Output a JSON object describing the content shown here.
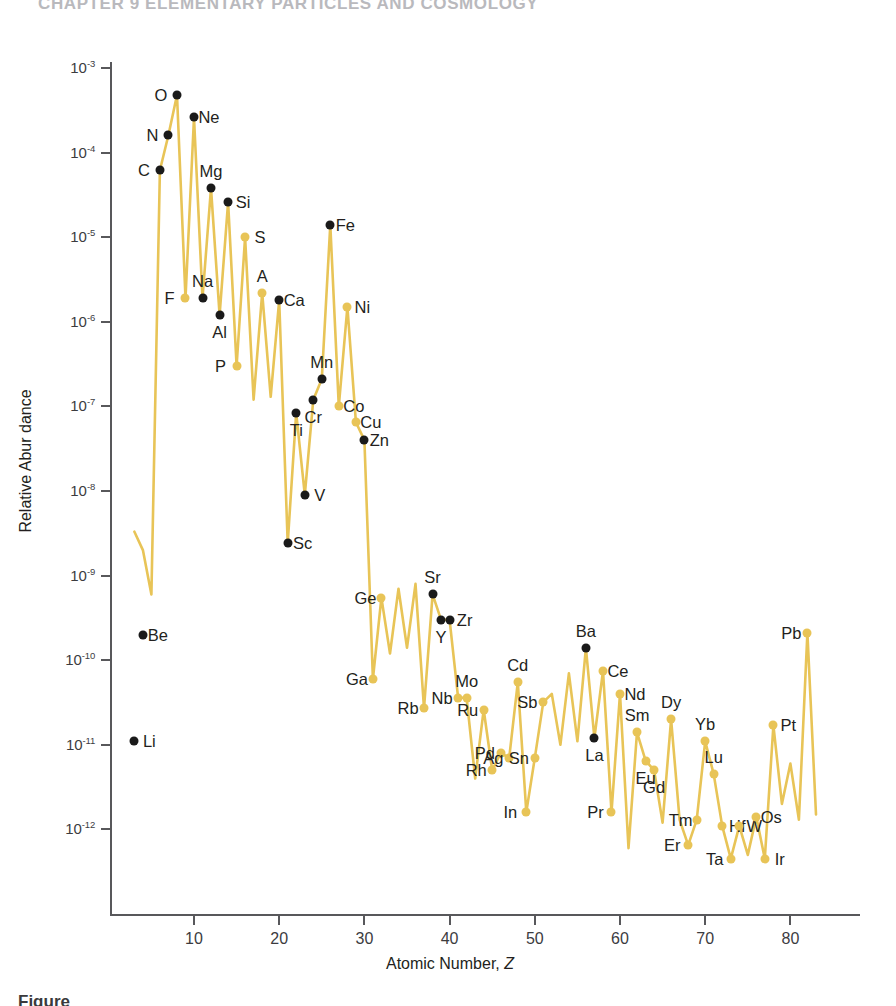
{
  "page": {
    "running_head": "CHAPTER 9   ELEMENTARY PARTICLES AND COSMOLOGY",
    "caption": "Figure"
  },
  "axes": {
    "ylabel": "Relative Abur dance",
    "xlabel_prefix": "Atomic Number, ",
    "xlabel_symbol": "Z",
    "yticks": [
      "10-3",
      "10-4",
      "10-5",
      "10-6",
      "10-7",
      "10-8",
      "10-9",
      "10-10",
      "10-11",
      "10-12"
    ],
    "xticks": [
      "10",
      "20",
      "30",
      "40",
      "50",
      "60",
      "70",
      "80"
    ]
  },
  "colors": {
    "gold": "#e8c457",
    "black": "#1a1a1a",
    "axis": "#58585b"
  },
  "chart_data": {
    "type": "scatter",
    "xlabel": "Atomic Number, Z",
    "ylabel": "Relative Abundance",
    "xlim": [
      1,
      84
    ],
    "ylim": [
      3e-13,
      0.002
    ],
    "yscale": "log",
    "grid": false,
    "legend": null,
    "note": "Black markers are labeled light/medium elements measured directly; gold markers and the gold zig-zag polyline trace the full abundance curve including the odd-even (Oddo-Harkins) sawtooth.",
    "points": [
      {
        "symbol": "Li",
        "z": 3,
        "abundance": 1.1e-11,
        "color": "black",
        "label_side": "right"
      },
      {
        "symbol": "Be",
        "z": 4,
        "abundance": 2e-10,
        "color": "black",
        "label_side": "right"
      },
      {
        "symbol": "C",
        "z": 6,
        "abundance": 6.2e-05,
        "color": "black",
        "label_side": "left"
      },
      {
        "symbol": "N",
        "z": 7,
        "abundance": 0.00016,
        "color": "black",
        "label_side": "left"
      },
      {
        "symbol": "O",
        "z": 8,
        "abundance": 0.00048,
        "color": "black",
        "label_side": "left"
      },
      {
        "symbol": "F",
        "z": 9,
        "abundance": 1.9e-06,
        "color": "gold",
        "label_side": "left"
      },
      {
        "symbol": "Ne",
        "z": 10,
        "abundance": 0.00026,
        "color": "black",
        "label_side": "right"
      },
      {
        "symbol": "Na",
        "z": 11,
        "abundance": 1.9e-06,
        "color": "black",
        "label_side": "above"
      },
      {
        "symbol": "Mg",
        "z": 12,
        "abundance": 3.8e-05,
        "color": "black",
        "label_side": "above"
      },
      {
        "symbol": "Al",
        "z": 13,
        "abundance": 1.2e-06,
        "color": "black",
        "label_side": "below"
      },
      {
        "symbol": "Si",
        "z": 14,
        "abundance": 2.6e-05,
        "color": "black",
        "label_side": "right"
      },
      {
        "symbol": "P",
        "z": 15,
        "abundance": 3e-07,
        "color": "gold",
        "label_side": "left"
      },
      {
        "symbol": "S",
        "z": 16,
        "abundance": 1e-05,
        "color": "gold",
        "label_side": "right"
      },
      {
        "symbol": "A",
        "z": 18,
        "abundance": 2.2e-06,
        "color": "gold",
        "label_side": "above"
      },
      {
        "symbol": "Ca",
        "z": 20,
        "abundance": 1.8e-06,
        "color": "black",
        "label_side": "right"
      },
      {
        "symbol": "Sc",
        "z": 21,
        "abundance": 2.4e-09,
        "color": "black",
        "label_side": "right"
      },
      {
        "symbol": "Ti",
        "z": 22,
        "abundance": 8.4e-08,
        "color": "black",
        "label_side": "below"
      },
      {
        "symbol": "V",
        "z": 23,
        "abundance": 9e-09,
        "color": "black",
        "label_side": "right"
      },
      {
        "symbol": "Cr",
        "z": 24,
        "abundance": 1.2e-07,
        "color": "black",
        "label_side": "below"
      },
      {
        "symbol": "Mn",
        "z": 25,
        "abundance": 2.1e-07,
        "color": "black",
        "label_side": "above"
      },
      {
        "symbol": "Fe",
        "z": 26,
        "abundance": 1.4e-05,
        "color": "black",
        "label_side": "right"
      },
      {
        "symbol": "Co",
        "z": 27,
        "abundance": 1e-07,
        "color": "gold",
        "label_side": "right"
      },
      {
        "symbol": "Ni",
        "z": 28,
        "abundance": 1.5e-06,
        "color": "gold",
        "label_side": "right"
      },
      {
        "symbol": "Cu",
        "z": 29,
        "abundance": 6.5e-08,
        "color": "gold",
        "label_side": "right"
      },
      {
        "symbol": "Zn",
        "z": 30,
        "abundance": 4e-08,
        "color": "black",
        "label_side": "right"
      },
      {
        "symbol": "Ga",
        "z": 31,
        "abundance": 6e-11,
        "color": "gold",
        "label_side": "left"
      },
      {
        "symbol": "Ge",
        "z": 32,
        "abundance": 5.5e-10,
        "color": "gold",
        "label_side": "left"
      },
      {
        "symbol": "Rb",
        "z": 37,
        "abundance": 2.7e-11,
        "color": "gold",
        "label_side": "left"
      },
      {
        "symbol": "Sr",
        "z": 38,
        "abundance": 6e-10,
        "color": "black",
        "label_side": "above"
      },
      {
        "symbol": "Y",
        "z": 39,
        "abundance": 3e-10,
        "color": "black",
        "label_side": "below"
      },
      {
        "symbol": "Zr",
        "z": 40,
        "abundance": 3e-10,
        "color": "black",
        "label_side": "right"
      },
      {
        "symbol": "Nb",
        "z": 41,
        "abundance": 3.6e-11,
        "color": "gold",
        "label_side": "left"
      },
      {
        "symbol": "Mo",
        "z": 42,
        "abundance": 3.6e-11,
        "color": "gold",
        "label_side": "above"
      },
      {
        "symbol": "Ru",
        "z": 44,
        "abundance": 2.6e-11,
        "color": "gold",
        "label_side": "left"
      },
      {
        "symbol": "Rh",
        "z": 45,
        "abundance": 5e-12,
        "color": "gold",
        "label_side": "left"
      },
      {
        "symbol": "Pd",
        "z": 46,
        "abundance": 8e-12,
        "color": "gold",
        "label_side": "left"
      },
      {
        "symbol": "Ag",
        "z": 47,
        "abundance": 7e-12,
        "color": "gold",
        "label_side": "left"
      },
      {
        "symbol": "Cd",
        "z": 48,
        "abundance": 5.5e-11,
        "color": "gold",
        "label_side": "above"
      },
      {
        "symbol": "In",
        "z": 49,
        "abundance": 1.6e-12,
        "color": "gold",
        "label_side": "left"
      },
      {
        "symbol": "Sn",
        "z": 50,
        "abundance": 7e-12,
        "color": "gold",
        "label_side": "left"
      },
      {
        "symbol": "Sb",
        "z": 51,
        "abundance": 3.2e-11,
        "color": "gold",
        "label_side": "left"
      },
      {
        "symbol": "Ba",
        "z": 56,
        "abundance": 1.4e-10,
        "color": "black",
        "label_side": "above"
      },
      {
        "symbol": "La",
        "z": 57,
        "abundance": 1.2e-11,
        "color": "black",
        "label_side": "below"
      },
      {
        "symbol": "Ce",
        "z": 58,
        "abundance": 7.5e-11,
        "color": "gold",
        "label_side": "right"
      },
      {
        "symbol": "Pr",
        "z": 59,
        "abundance": 1.6e-12,
        "color": "gold",
        "label_side": "left"
      },
      {
        "symbol": "Nd",
        "z": 60,
        "abundance": 4e-11,
        "color": "gold",
        "label_side": "right"
      },
      {
        "symbol": "Sm",
        "z": 62,
        "abundance": 1.4e-11,
        "color": "gold",
        "label_side": "above"
      },
      {
        "symbol": "Eu",
        "z": 63,
        "abundance": 6.5e-12,
        "color": "gold",
        "label_side": "below"
      },
      {
        "symbol": "Gd",
        "z": 64,
        "abundance": 5e-12,
        "color": "gold",
        "label_side": "below"
      },
      {
        "symbol": "Dy",
        "z": 66,
        "abundance": 2e-11,
        "color": "gold",
        "label_side": "above"
      },
      {
        "symbol": "Er",
        "z": 68,
        "abundance": 6.5e-13,
        "color": "gold",
        "label_side": "left"
      },
      {
        "symbol": "Tm",
        "z": 69,
        "abundance": 1.3e-12,
        "color": "gold",
        "label_side": "left"
      },
      {
        "symbol": "Yb",
        "z": 70,
        "abundance": 1.1e-11,
        "color": "gold",
        "label_side": "above"
      },
      {
        "symbol": "Lu",
        "z": 71,
        "abundance": 4.5e-12,
        "color": "gold",
        "label_side": "above"
      },
      {
        "symbol": "Hf",
        "z": 72,
        "abundance": 1.1e-12,
        "color": "gold",
        "label_side": "right"
      },
      {
        "symbol": "Ta",
        "z": 73,
        "abundance": 4.5e-13,
        "color": "gold",
        "label_side": "left"
      },
      {
        "symbol": "W",
        "z": 74,
        "abundance": 1.1e-12,
        "color": "gold",
        "label_side": "right"
      },
      {
        "symbol": "Os",
        "z": 76,
        "abundance": 1.4e-12,
        "color": "gold",
        "label_side": "right"
      },
      {
        "symbol": "Ir",
        "z": 77,
        "abundance": 4.5e-13,
        "color": "gold",
        "label_side": "right"
      },
      {
        "symbol": "Pt",
        "z": 78,
        "abundance": 1.7e-11,
        "color": "gold",
        "label_side": "right"
      },
      {
        "symbol": "Pb",
        "z": 82,
        "abundance": 2.1e-10,
        "color": "gold",
        "label_side": "left"
      }
    ],
    "curve_z": [
      3,
      4,
      5,
      6,
      7,
      8,
      9,
      10,
      11,
      12,
      13,
      14,
      15,
      16,
      17,
      18,
      19,
      20,
      21,
      22,
      23,
      24,
      25,
      26,
      27,
      28,
      29,
      30,
      31,
      32,
      33,
      34,
      35,
      36,
      37,
      38,
      39,
      40,
      41,
      42,
      43,
      44,
      45,
      46,
      47,
      48,
      49,
      50,
      51,
      52,
      53,
      54,
      55,
      56,
      57,
      58,
      59,
      60,
      61,
      62,
      63,
      64,
      65,
      66,
      67,
      68,
      69,
      70,
      71,
      72,
      73,
      74,
      75,
      76,
      77,
      78,
      79,
      80,
      81,
      82,
      83
    ],
    "curve_y": [
      3.3e-09,
      2e-09,
      6e-10,
      6.2e-05,
      0.00016,
      0.00048,
      1.9e-06,
      0.00026,
      1.9e-06,
      3.8e-05,
      1.2e-06,
      2.6e-05,
      3e-07,
      1e-05,
      1.2e-07,
      2.2e-06,
      1.3e-07,
      1.8e-06,
      2.4e-09,
      8.4e-08,
      9e-09,
      1.2e-07,
      2.1e-07,
      1.4e-05,
      1e-07,
      1.5e-06,
      6.5e-08,
      4e-08,
      6e-11,
      5.5e-10,
      1.2e-10,
      7e-10,
      1.4e-10,
      8e-10,
      2.7e-11,
      6e-10,
      3e-10,
      3e-10,
      3.6e-11,
      3.6e-11,
      4e-12,
      2.6e-11,
      5e-12,
      8e-12,
      7e-12,
      5.5e-11,
      1.6e-12,
      7e-12,
      3.2e-11,
      4e-11,
      1e-11,
      7e-11,
      1.1e-11,
      1.4e-10,
      1.2e-11,
      7.5e-11,
      1.6e-12,
      4e-11,
      6e-13,
      1.4e-11,
      6.5e-12,
      5e-12,
      1.2e-12,
      2e-11,
      1.3e-12,
      6.5e-13,
      1.3e-12,
      1.1e-11,
      4.5e-12,
      1.1e-12,
      4.5e-13,
      1.1e-12,
      5e-13,
      1.4e-12,
      4.5e-13,
      1.7e-11,
      2e-12,
      6e-12,
      1.3e-12,
      2.1e-10,
      1.5e-12
    ]
  }
}
